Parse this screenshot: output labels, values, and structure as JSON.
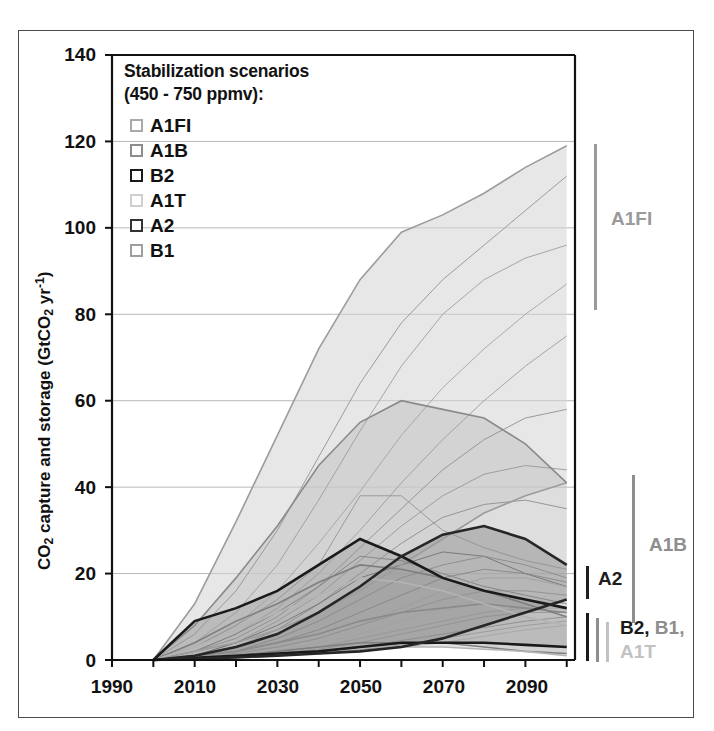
{
  "figure": {
    "axes": {
      "ylabel": "CO2 capture and storage (GtCO2 yr-1)",
      "ylabel_parts": {
        "pre": "CO",
        "sub1": "2",
        "mid": " capture and storage (GtCO",
        "sub2": "2",
        "mid2": " yr",
        "sup": "-1",
        "post": ")"
      },
      "yticks": [
        "0",
        "20",
        "40",
        "60",
        "80",
        "100",
        "120",
        "140"
      ],
      "xticks": [
        "1990",
        "2010",
        "2030",
        "2050",
        "2070",
        "2090"
      ],
      "ylim": [
        0,
        140
      ],
      "xlim": [
        1990,
        2102
      ],
      "grid": "horizontal"
    },
    "legend": {
      "title_line1": "Stabilization scenarios",
      "title_line2": "(450 - 750 ppmv):",
      "items": [
        {
          "label": "A1FI",
          "color": "#a9a9a9"
        },
        {
          "label": "A1B",
          "color": "#8c8c8c"
        },
        {
          "label": "B2",
          "color": "#1a1a1a"
        },
        {
          "label": "A1T",
          "color": "#cfcfcf"
        },
        {
          "label": "A2",
          "color": "#333333"
        },
        {
          "label": "B1",
          "color": "#9e9e9e"
        }
      ]
    },
    "range_annotations": [
      {
        "name": "A1FI",
        "label": "A1FI",
        "color": "#9a9a9a",
        "low": 80,
        "high": 119
      },
      {
        "name": "A1B",
        "label": "A1B",
        "color": "#8e8e8e",
        "low": 11,
        "high": 41
      },
      {
        "name": "A2",
        "label": "A2",
        "color": "#1f1f1f",
        "low": 15,
        "high": 22
      },
      {
        "name": "B2-B1-A1T",
        "label_parts": [
          "B2,",
          "B1,",
          "A1T"
        ],
        "colors": [
          "#1a1a1a",
          "#8e8e8e",
          "#c2c2c2"
        ],
        "low": 1,
        "high": 11
      }
    ]
  },
  "chart_data": {
    "type": "area",
    "title": "",
    "xlabel": "",
    "ylabel": "CO2 capture and storage (GtCO2 yr-1)",
    "xlim": [
      1990,
      2102
    ],
    "ylim": [
      0,
      140
    ],
    "grid": true,
    "legend_position": "top-left-inside",
    "x": [
      2000,
      2010,
      2020,
      2030,
      2040,
      2050,
      2060,
      2070,
      2080,
      2090,
      2100
    ],
    "bands": [
      {
        "name": "A1FI",
        "fill": "#d4d4d4",
        "stroke": "#9c9c9c",
        "upper": [
          0,
          13,
          32,
          52,
          72,
          88,
          99,
          103,
          108,
          114,
          119
        ],
        "lower": [
          0,
          2,
          4,
          7,
          11,
          16,
          22,
          28,
          34,
          38,
          41
        ]
      },
      {
        "name": "A1B",
        "fill": "#c2c2c2",
        "stroke": "#8a8a8a",
        "upper": [
          0,
          8,
          19,
          31,
          45,
          55,
          60,
          58,
          56,
          50,
          41
        ],
        "lower": [
          0,
          1,
          2,
          4,
          6,
          9,
          11,
          12,
          13,
          12,
          11
        ]
      },
      {
        "name": "B1",
        "fill": "#bdbdbd",
        "stroke": "#7f7f7f",
        "upper": [
          0,
          4,
          9,
          13,
          18,
          22,
          21,
          19,
          16,
          13,
          10
        ],
        "lower": [
          0,
          0.5,
          1,
          2,
          3,
          4,
          4,
          4,
          3,
          2,
          1.5
        ]
      },
      {
        "name": "A1T",
        "fill": "#cccccc",
        "stroke": "#b4b4b4",
        "upper": [
          0,
          3,
          7,
          11,
          15,
          19,
          18,
          16,
          13,
          10,
          8
        ],
        "lower": [
          0,
          0.5,
          1,
          1.5,
          2,
          3,
          3,
          3,
          2.5,
          2,
          1
        ]
      },
      {
        "name": "B2",
        "fill": "#a8a8a8",
        "stroke": "#1a1a1a",
        "upper": [
          0,
          9,
          12,
          16,
          22,
          28,
          24,
          19,
          16,
          14,
          12
        ],
        "lower": [
          0,
          0.5,
          1,
          1.5,
          2,
          3,
          4,
          4,
          4,
          3.5,
          3
        ]
      },
      {
        "name": "A2",
        "fill": "#969696",
        "stroke": "#262626",
        "upper": [
          0,
          1,
          3,
          6,
          11,
          17,
          24,
          29,
          31,
          28,
          22
        ],
        "lower": [
          0,
          0.3,
          0.6,
          1,
          1.5,
          2,
          3,
          5,
          8,
          11,
          14
        ]
      }
    ],
    "individual_lines": [
      {
        "name": "l1",
        "color": "#8e8e8e",
        "y": [
          0,
          6,
          16,
          30,
          47,
          64,
          78,
          88,
          96,
          104,
          112
        ]
      },
      {
        "name": "l2",
        "color": "#9a9a9a",
        "y": [
          0,
          4,
          11,
          22,
          37,
          53,
          68,
          80,
          88,
          93,
          96
        ]
      },
      {
        "name": "l3",
        "color": "#a0a0a0",
        "y": [
          0,
          3,
          8,
          16,
          27,
          39,
          52,
          63,
          72,
          80,
          87
        ]
      },
      {
        "name": "l4",
        "color": "#999999",
        "y": [
          0,
          2,
          6,
          12,
          20,
          30,
          41,
          51,
          60,
          68,
          75
        ]
      },
      {
        "name": "l5",
        "color": "#8c8c8c",
        "y": [
          0,
          2,
          5,
          10,
          17,
          26,
          35,
          44,
          51,
          56,
          58
        ]
      },
      {
        "name": "l6",
        "color": "#949494",
        "y": [
          0,
          1,
          4,
          9,
          15,
          23,
          31,
          38,
          43,
          45,
          44
        ]
      },
      {
        "name": "l7",
        "color": "#8a8a8a",
        "y": [
          0,
          1,
          3,
          7,
          13,
          20,
          27,
          33,
          36,
          37,
          35
        ]
      },
      {
        "name": "l8",
        "color": "#909090",
        "y": [
          0,
          3,
          8,
          14,
          22,
          38,
          38,
          30,
          26,
          23,
          21
        ]
      },
      {
        "name": "l9",
        "color": "#7e7e7e",
        "y": [
          0,
          2,
          6,
          11,
          17,
          24,
          23,
          20,
          17,
          15,
          13
        ]
      },
      {
        "name": "l10",
        "color": "#6f6f6f",
        "y": [
          0,
          1,
          4,
          8,
          13,
          19,
          22,
          25,
          24,
          20,
          17
        ]
      },
      {
        "name": "l11",
        "color": "#878787",
        "y": [
          0,
          1,
          2,
          5,
          9,
          14,
          19,
          22,
          24,
          22,
          19
        ]
      },
      {
        "name": "l12",
        "color": "#848484",
        "y": [
          0,
          1,
          2,
          4,
          7,
          11,
          15,
          19,
          21,
          20,
          18
        ]
      },
      {
        "name": "l13",
        "color": "#9c9c9c",
        "y": [
          0,
          1,
          2,
          3,
          5,
          8,
          12,
          16,
          19,
          19,
          17
        ]
      },
      {
        "name": "l14",
        "color": "#8e8e8e",
        "y": [
          0,
          0.5,
          1.5,
          3,
          5,
          8,
          11,
          14,
          16,
          16,
          15
        ]
      },
      {
        "name": "l15",
        "color": "#a2a2a2",
        "y": [
          0,
          0.5,
          1,
          2,
          4,
          6,
          9,
          12,
          14,
          14,
          13
        ]
      },
      {
        "name": "l16",
        "color": "#959595",
        "y": [
          0,
          0.5,
          1,
          2,
          3,
          5,
          7,
          9,
          11,
          12,
          12
        ]
      },
      {
        "name": "l17",
        "color": "#8f8f8f",
        "y": [
          0,
          0.4,
          0.8,
          1.5,
          2.5,
          4,
          6,
          8,
          10,
          11,
          11
        ]
      },
      {
        "name": "l18",
        "color": "#8b8b8b",
        "y": [
          0,
          0.3,
          0.7,
          1.2,
          2,
          3,
          4.5,
          6,
          7.5,
          9,
          10
        ]
      },
      {
        "name": "l19",
        "color": "#989898",
        "y": [
          0,
          0.3,
          0.6,
          1,
          1.6,
          2.4,
          3.5,
          5,
          6.5,
          8,
          9
        ]
      },
      {
        "name": "l20",
        "color": "#a4a4a4",
        "y": [
          0,
          0.2,
          0.5,
          0.9,
          1.4,
          2,
          3,
          4,
          5.5,
          7,
          8
        ]
      }
    ]
  }
}
